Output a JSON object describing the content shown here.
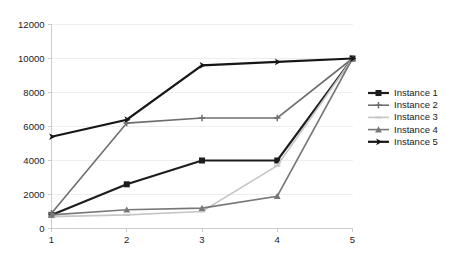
{
  "chart_data": {
    "type": "line",
    "title": "",
    "xlabel": "",
    "ylabel": "",
    "x": [
      1,
      2,
      3,
      4,
      5
    ],
    "categories": [
      "1",
      "2",
      "3",
      "4",
      "5"
    ],
    "xlim": [
      1,
      5
    ],
    "ylim": [
      0,
      12000
    ],
    "y_ticks": [
      0,
      2000,
      4000,
      6000,
      8000,
      10000,
      12000
    ],
    "y_tick_labels": [
      "0",
      "2000",
      "4000",
      "6000",
      "8000",
      "10000",
      "12000"
    ],
    "x_ticks": [
      1,
      2,
      3,
      4,
      5
    ],
    "x_tick_labels": [
      "1",
      "2",
      "3",
      "4",
      "5"
    ],
    "grid": true,
    "legend_position": "right",
    "series": [
      {
        "name": "Instance 1",
        "values": [
          800,
          2600,
          4000,
          4000,
          10000
        ],
        "color": "#1c1c1c",
        "marker": "square",
        "line_width": 2.2
      },
      {
        "name": "Instance 2",
        "values": [
          900,
          6200,
          6500,
          6500,
          10000
        ],
        "color": "#6e6e6e",
        "marker": "plus",
        "line_width": 1.6
      },
      {
        "name": "Instance 3",
        "values": [
          700,
          800,
          1000,
          3700,
          10000
        ],
        "color": "#c6c6c6",
        "marker": "dash",
        "line_width": 1.6
      },
      {
        "name": "Instance 4",
        "values": [
          800,
          1100,
          1200,
          1900,
          10000
        ],
        "color": "#787878",
        "marker": "triangle",
        "line_width": 1.6
      },
      {
        "name": "Instance 5",
        "values": [
          5400,
          6400,
          9600,
          9800,
          10000
        ],
        "color": "#161616",
        "marker": "arrow",
        "line_width": 2.2
      }
    ]
  },
  "legend": {
    "entries": [
      {
        "label": "Instance 1"
      },
      {
        "label": "Instance 2"
      },
      {
        "label": "Instance 3"
      },
      {
        "label": "Instance 4"
      },
      {
        "label": "Instance 5"
      }
    ]
  }
}
